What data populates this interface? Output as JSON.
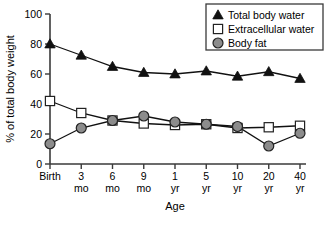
{
  "chart_data": {
    "type": "line",
    "title": "",
    "xlabel": "Age",
    "ylabel": "% of total body weight",
    "categories": [
      "Birth",
      "3\nmo",
      "6\nmo",
      "9\nmo",
      "1\nyr",
      "5\nyr",
      "10\nyr",
      "20\nyr",
      "40\nyr"
    ],
    "category_lines": [
      [
        "Birth",
        ""
      ],
      [
        "3",
        "mo"
      ],
      [
        "6",
        "mo"
      ],
      [
        "9",
        "mo"
      ],
      [
        "1",
        "yr"
      ],
      [
        "5",
        "yr"
      ],
      [
        "10",
        "yr"
      ],
      [
        "20",
        "yr"
      ],
      [
        "40",
        "yr"
      ]
    ],
    "ylim": [
      0,
      100
    ],
    "yticks": [
      0,
      20,
      40,
      60,
      80,
      100
    ],
    "grid": false,
    "legend_position": "top-right",
    "series": [
      {
        "name": "Total body water",
        "marker": "filled-triangle",
        "color": "#111111",
        "values": [
          80,
          72.5,
          65,
          61,
          60,
          62,
          58.5,
          61.5,
          57
        ]
      },
      {
        "name": "Extracellular water",
        "marker": "open-square",
        "color": "#ffffff",
        "values": [
          42,
          34,
          29,
          27,
          26,
          26.5,
          24,
          24.5,
          25.5
        ]
      },
      {
        "name": "Body fat",
        "marker": "filled-circle",
        "color": "#8c8c8c",
        "values": [
          13.5,
          24,
          29,
          32,
          28,
          26.5,
          25,
          12,
          20.5
        ]
      }
    ]
  },
  "legend": {
    "items": [
      {
        "label": "Total body water",
        "marker": "filled-triangle"
      },
      {
        "label": "Extracellular water",
        "marker": "open-square"
      },
      {
        "label": "Body fat",
        "marker": "filled-circle"
      }
    ]
  },
  "axes": {
    "y_title": "% of total body weight",
    "x_title": "Age",
    "y_tick_labels": [
      "0",
      "20",
      "40",
      "60",
      "80",
      "100"
    ]
  }
}
